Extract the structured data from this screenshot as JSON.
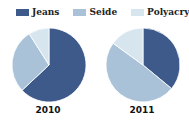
{
  "chart_data": {
    "type": "pie",
    "legend": [
      "Jeans",
      "Seide",
      "Polyacryl"
    ],
    "colors": [
      "#3d5a8a",
      "#a9c2d8",
      "#d7e5ef"
    ],
    "legend_position": "top",
    "charts": [
      {
        "title": "2010",
        "categories": [
          "Jeans",
          "Seide",
          "Polyacryl"
        ],
        "values": [
          63,
          28,
          9
        ]
      },
      {
        "title": "2011",
        "categories": [
          "Jeans",
          "Seide",
          "Polyacryl"
        ],
        "values": [
          36,
          49,
          15
        ]
      }
    ]
  },
  "legend": {
    "items": [
      {
        "label": "Jeans",
        "color": "#3d5a8a"
      },
      {
        "label": "Seide",
        "color": "#a9c2d8"
      },
      {
        "label": "Polyacryl",
        "color": "#d7e5ef"
      }
    ]
  },
  "pies": [
    {
      "label": "2010"
    },
    {
      "label": "2011"
    }
  ]
}
